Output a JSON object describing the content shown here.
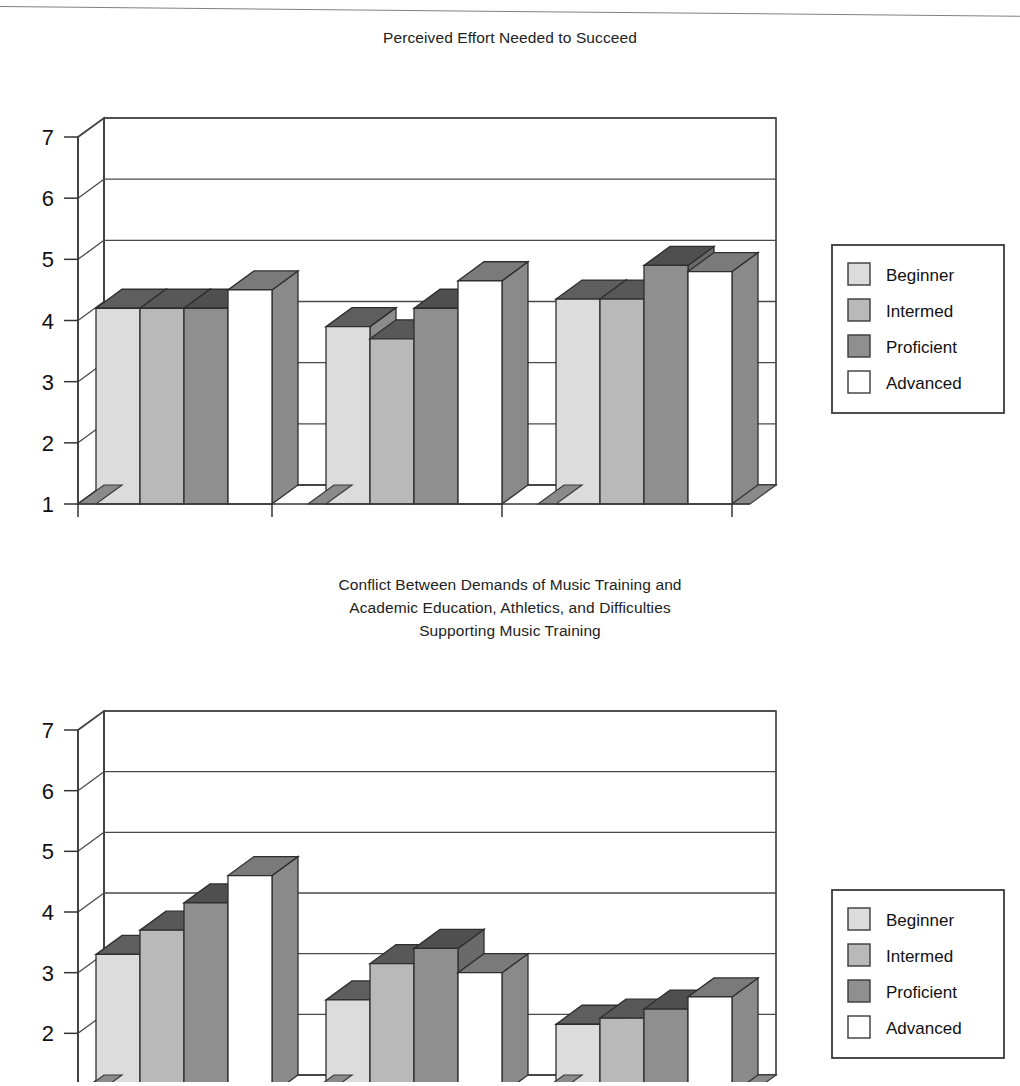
{
  "page": {
    "scan_artifact": "top-scan-line"
  },
  "charts": [
    {
      "id": "chart-effort",
      "title": [
        "Perceived Effort Needed to Succeed"
      ],
      "legend": [
        "Beginner",
        "Intermed",
        "Proficient",
        "Advanced"
      ],
      "y_ticks": [
        "7",
        "6",
        "5",
        "4",
        "3",
        "2",
        "1"
      ],
      "categories": [
        "Music",
        "Academics",
        "Athletics"
      ]
    },
    {
      "id": "chart-conflict",
      "title": [
        "Conflict Between Demands of Music Training and",
        "Academic Education, Athletics, and Difficulties",
        "Supporting Music Training"
      ],
      "legend": [
        "Beginner",
        "Intermed",
        "Proficient",
        "Advanced"
      ],
      "y_ticks": [
        "7",
        "6",
        "5",
        "4",
        "3",
        "2",
        "1"
      ],
      "categories": [
        "MVS. AC",
        "MVS. AT",
        "Difficulty"
      ]
    }
  ],
  "colors": {
    "beginner": "#dcdcdc",
    "intermed": "#b9b9b9",
    "proficient": "#8f8f8f",
    "advanced": "#ffffff",
    "beginner_top": "#5e5e5e",
    "intermed_top": "#585858",
    "proficient_top": "#4f4f4f",
    "advanced_top": "#7a7a7a",
    "beginner_side": "#8c8c8c",
    "intermed_side": "#7d7d7d",
    "proficient_side": "#6a6a6a",
    "advanced_side": "#8a8a8a",
    "frame": "#3a3a3a",
    "text": "#1a1a1a"
  },
  "chart_data": [
    {
      "type": "bar",
      "title": "Perceived Effort Needed to Succeed",
      "xlabel": "",
      "ylabel": "",
      "ylim": [
        1,
        7
      ],
      "yticks": [
        1,
        2,
        3,
        4,
        5,
        6,
        7
      ],
      "grid": true,
      "legend_position": "right",
      "three_d": true,
      "categories": [
        "Music",
        "Academics",
        "Athletics"
      ],
      "series": [
        {
          "name": "Beginner",
          "values": [
            4.2,
            3.9,
            4.35
          ]
        },
        {
          "name": "Intermed",
          "values": [
            4.2,
            3.7,
            4.35
          ]
        },
        {
          "name": "Proficient",
          "values": [
            4.2,
            4.2,
            4.9
          ]
        },
        {
          "name": "Advanced",
          "values": [
            4.5,
            4.65,
            4.8
          ]
        }
      ]
    },
    {
      "type": "bar",
      "title": "Conflict Between Demands of Music Training and Academic Education, Athletics, and Difficulties Supporting Music Training",
      "xlabel": "",
      "ylabel": "",
      "ylim": [
        1,
        7
      ],
      "yticks": [
        1,
        2,
        3,
        4,
        5,
        6,
        7
      ],
      "grid": true,
      "legend_position": "right",
      "three_d": true,
      "categories": [
        "MVS. AC",
        "MVS. AT",
        "Difficulty"
      ],
      "series": [
        {
          "name": "Beginner",
          "values": [
            3.3,
            2.55,
            2.15
          ]
        },
        {
          "name": "Intermed",
          "values": [
            3.7,
            3.15,
            2.25
          ]
        },
        {
          "name": "Proficient",
          "values": [
            4.15,
            3.4,
            2.4
          ]
        },
        {
          "name": "Advanced",
          "values": [
            4.6,
            3.0,
            2.6
          ]
        }
      ]
    }
  ]
}
